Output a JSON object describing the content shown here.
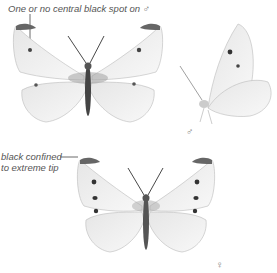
{
  "annotations": {
    "male_note": "One or no central black spot on ♂",
    "female_note_line1": "black confined",
    "female_note_line2": "to extreme tip"
  },
  "symbols": {
    "male": "♂",
    "female": "♀"
  },
  "figures": [
    {
      "name": "male-upperside",
      "description": "male butterfly, upperside, wings spread"
    },
    {
      "name": "male-underside",
      "description": "butterfly at rest, side view, wings closed"
    },
    {
      "name": "female-upperside",
      "description": "female butterfly, upperside, wings spread"
    }
  ]
}
